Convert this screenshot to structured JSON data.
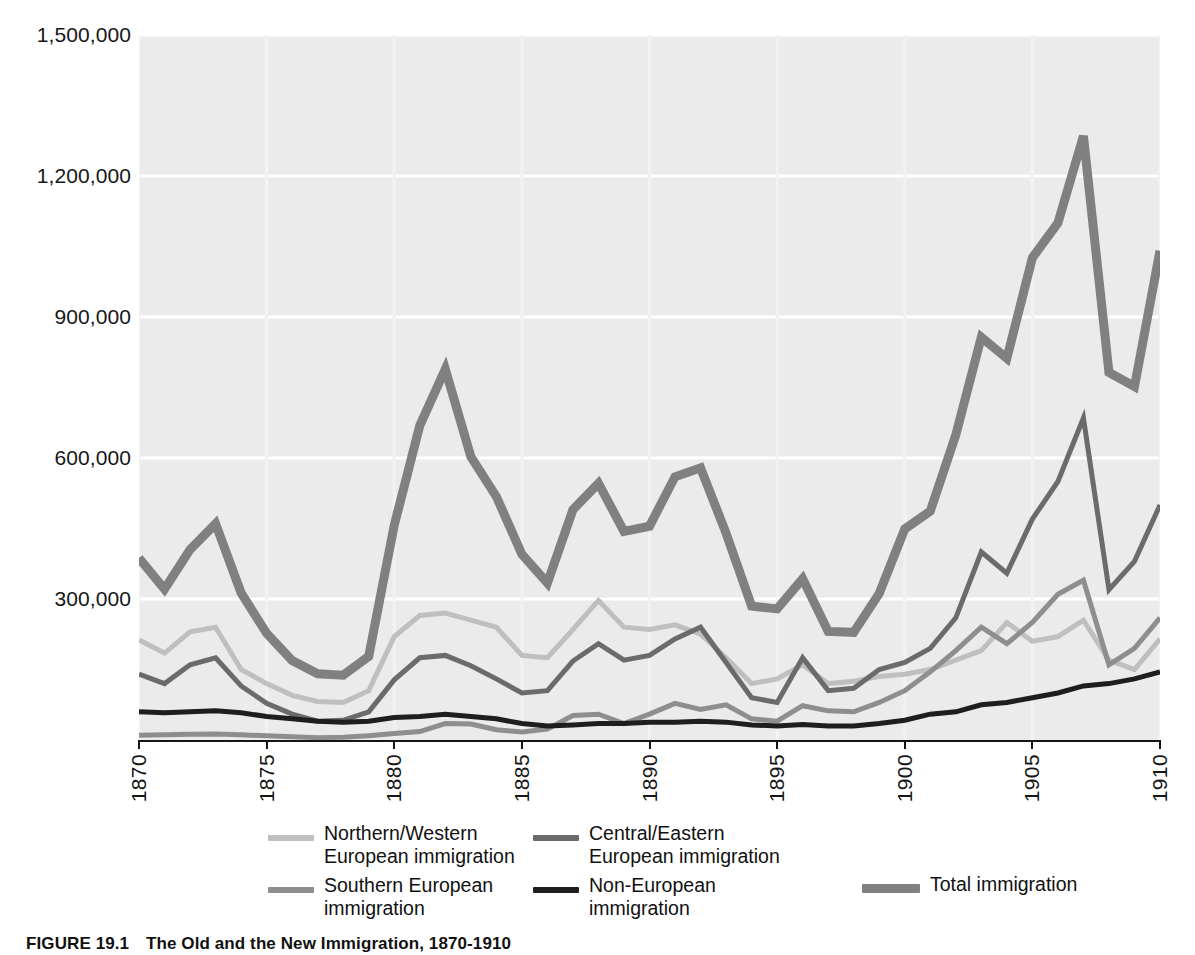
{
  "chart_data": {
    "type": "line",
    "title": "The Old and the New Immigration, 1870-1910",
    "xlabel": "",
    "ylabel": "",
    "xlim": [
      1870,
      1910
    ],
    "ylim": [
      0,
      1500000
    ],
    "grid": true,
    "y_ticks": [
      0,
      300000,
      600000,
      900000,
      1200000,
      1500000
    ],
    "y_tick_labels": [
      "",
      "300,000",
      "600,000",
      "900,000",
      "1,200,000",
      "1,500,000"
    ],
    "x_ticks": [
      1870,
      1875,
      1880,
      1885,
      1890,
      1895,
      1900,
      1905,
      1910
    ],
    "x_tick_labels": [
      "1870",
      "1875",
      "1880",
      "1885",
      "1890",
      "1895",
      "1900",
      "1905",
      "1910"
    ],
    "x": [
      1870,
      1871,
      1872,
      1873,
      1874,
      1875,
      1876,
      1877,
      1878,
      1879,
      1880,
      1881,
      1882,
      1883,
      1884,
      1885,
      1886,
      1887,
      1888,
      1889,
      1890,
      1891,
      1892,
      1893,
      1894,
      1895,
      1896,
      1897,
      1898,
      1899,
      1900,
      1901,
      1902,
      1903,
      1904,
      1905,
      1906,
      1907,
      1908,
      1909,
      1910
    ],
    "legend_position": "below",
    "series": [
      {
        "name": "Northern/Western European immigration",
        "color": "#bfbfbf",
        "width": 5,
        "values": [
          213000,
          185000,
          230000,
          240000,
          150000,
          120000,
          95000,
          82000,
          80000,
          105000,
          220000,
          265000,
          270000,
          255000,
          240000,
          180000,
          175000,
          235000,
          297000,
          240000,
          235000,
          245000,
          225000,
          175000,
          120000,
          130000,
          160000,
          120000,
          125000,
          135000,
          140000,
          150000,
          170000,
          190000,
          250000,
          210000,
          220000,
          255000,
          170000,
          150000,
          215000
        ]
      },
      {
        "name": "Southern European immigration",
        "color": "#8e8e8e",
        "width": 5,
        "values": [
          10000,
          11000,
          12000,
          13000,
          11000,
          9000,
          7000,
          5000,
          6000,
          9000,
          14000,
          18000,
          35000,
          34000,
          22000,
          17000,
          23000,
          52000,
          55000,
          35000,
          55000,
          78000,
          65000,
          75000,
          45000,
          40000,
          73000,
          62000,
          60000,
          80000,
          105000,
          145000,
          190000,
          240000,
          205000,
          250000,
          310000,
          340000,
          160000,
          195000,
          260000
        ]
      },
      {
        "name": "Central/Eastern European immigration",
        "color": "#6b6b6b",
        "width": 5,
        "values": [
          140000,
          120000,
          160000,
          175000,
          115000,
          78000,
          55000,
          40000,
          42000,
          60000,
          128000,
          175000,
          180000,
          158000,
          130000,
          100000,
          105000,
          168000,
          205000,
          170000,
          180000,
          215000,
          240000,
          165000,
          90000,
          80000,
          175000,
          105000,
          110000,
          150000,
          165000,
          195000,
          260000,
          400000,
          355000,
          470000,
          550000,
          685000,
          320000,
          380000,
          500000
        ]
      },
      {
        "name": "Non-European immigration",
        "color": "#1e1e1e",
        "width": 5,
        "values": [
          60000,
          58000,
          60000,
          62000,
          58000,
          50000,
          45000,
          40000,
          38000,
          40000,
          48000,
          50000,
          55000,
          50000,
          45000,
          35000,
          30000,
          32000,
          35000,
          35000,
          38000,
          38000,
          40000,
          38000,
          32000,
          30000,
          33000,
          30000,
          30000,
          35000,
          42000,
          55000,
          60000,
          75000,
          80000,
          90000,
          100000,
          115000,
          120000,
          130000,
          145000
        ]
      },
      {
        "name": "Total immigration",
        "color": "#808080",
        "width": 9,
        "values": [
          387000,
          321000,
          405000,
          460000,
          313000,
          227000,
          169000,
          141000,
          138000,
          178000,
          457000,
          669000,
          789000,
          603000,
          518000,
          395000,
          334000,
          490000,
          546000,
          444000,
          455000,
          560000,
          579000,
          440000,
          285000,
          279000,
          343000,
          231000,
          229000,
          312000,
          449000,
          487000,
          649000,
          857000,
          812000,
          1026000,
          1100000,
          1285000,
          782000,
          752000,
          1041000
        ]
      }
    ]
  },
  "axis": {
    "y_labels": [
      {
        "value": 1500000,
        "text": "1,500,000"
      },
      {
        "value": 1200000,
        "text": "1,200,000"
      },
      {
        "value": 900000,
        "text": "900,000"
      },
      {
        "value": 600000,
        "text": "600,000"
      },
      {
        "value": 300000,
        "text": "300,000"
      }
    ],
    "x_labels": [
      "1870",
      "1875",
      "1880",
      "1885",
      "1890",
      "1895",
      "1900",
      "1905",
      "1910"
    ]
  },
  "legend": {
    "items": [
      {
        "label": "Northern/Western\nEuropean immigration",
        "color": "#bfbfbf",
        "thickness": 6
      },
      {
        "label": "Southern European\nimmigration",
        "color": "#8e8e8e",
        "thickness": 6
      },
      {
        "label": "Central/Eastern\nEuropean immigration",
        "color": "#6b6b6b",
        "thickness": 6
      },
      {
        "label": "Non-European\nimmigration",
        "color": "#1e1e1e",
        "thickness": 6
      },
      {
        "label": "Total immigration",
        "color": "#808080",
        "thickness": 9
      }
    ]
  },
  "caption": {
    "figure_number": "FIGURE 19.1",
    "text": "The Old and the New Immigration, 1870-1910"
  },
  "colors": {
    "plot_background": "#ebebeb",
    "gridline": "#ffffff",
    "axis": "#151515",
    "text": "#161616"
  }
}
